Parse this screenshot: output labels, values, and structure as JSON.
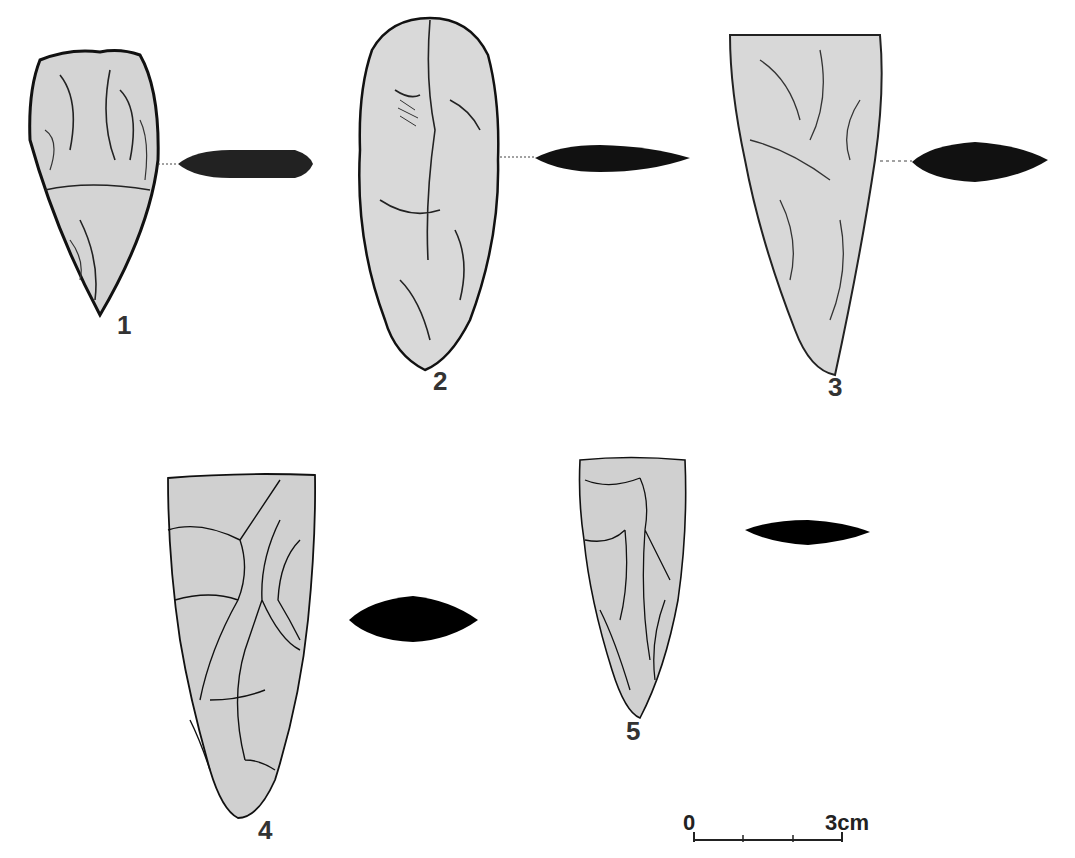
{
  "figure": {
    "artifacts": [
      {
        "id": "1",
        "label": "1",
        "style": "shaded",
        "fill": "#d4d4d4"
      },
      {
        "id": "2",
        "label": "2",
        "style": "shaded",
        "fill": "#d9d9d9"
      },
      {
        "id": "3",
        "label": "3",
        "style": "shaded",
        "fill": "#d8d8d8"
      },
      {
        "id": "4",
        "label": "4",
        "style": "outline",
        "fill": "#d0d0d0"
      },
      {
        "id": "5",
        "label": "5",
        "style": "outline",
        "fill": "#d0d0d0"
      }
    ],
    "scale_bar": {
      "start_label": "0",
      "end_label": "3cm",
      "divisions": 3
    }
  }
}
